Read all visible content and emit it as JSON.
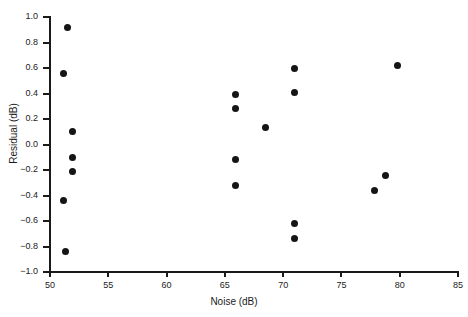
{
  "chart_data": {
    "type": "scatter",
    "title": "",
    "xlabel": "Noise (dB)",
    "ylabel": "Residual (dB)",
    "xlim": [
      50,
      85
    ],
    "ylim": [
      -1.0,
      1.0
    ],
    "grid": false,
    "legend": null,
    "xticks": [
      50,
      55,
      60,
      65,
      70,
      75,
      80,
      85
    ],
    "xtick_labels": [
      "50",
      "55",
      "60",
      "65",
      "70",
      "75",
      "80",
      "85"
    ],
    "yticks": [
      -1.0,
      -0.8,
      -0.6,
      -0.4,
      -0.2,
      0.0,
      0.2,
      0.4,
      0.6,
      0.8,
      1.0
    ],
    "ytick_labels": [
      "−1.0",
      "−0.8",
      "−0.6",
      "−0.4",
      "−0.2",
      "0.0",
      "0.2",
      "0.4",
      "0.6",
      "0.8",
      "1.0"
    ],
    "marker": "filled-circle",
    "marker_color": "#151515",
    "points": [
      {
        "x": 51.5,
        "y": 0.92
      },
      {
        "x": 51.2,
        "y": 0.56
      },
      {
        "x": 51.9,
        "y": 0.1
      },
      {
        "x": 51.9,
        "y": -0.1
      },
      {
        "x": 51.9,
        "y": -0.21
      },
      {
        "x": 51.2,
        "y": -0.44
      },
      {
        "x": 51.3,
        "y": -0.84
      },
      {
        "x": 65.9,
        "y": 0.39
      },
      {
        "x": 65.9,
        "y": 0.28
      },
      {
        "x": 65.9,
        "y": -0.12
      },
      {
        "x": 65.9,
        "y": -0.32
      },
      {
        "x": 68.5,
        "y": 0.13
      },
      {
        "x": 71.0,
        "y": 0.6
      },
      {
        "x": 71.0,
        "y": 0.41
      },
      {
        "x": 71.0,
        "y": -0.62
      },
      {
        "x": 71.0,
        "y": -0.74
      },
      {
        "x": 77.8,
        "y": -0.36
      },
      {
        "x": 78.8,
        "y": -0.24
      },
      {
        "x": 79.8,
        "y": 0.62
      }
    ]
  }
}
